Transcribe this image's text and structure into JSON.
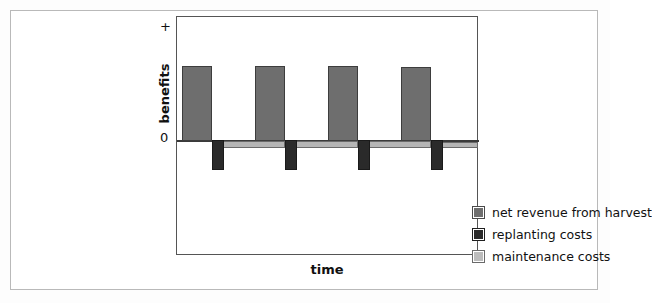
{
  "chart_data": {
    "type": "bar",
    "title": "",
    "subtitle": "",
    "xlabel": "time",
    "ylabel": "benefits",
    "ytick_labels": [
      "+",
      "0"
    ],
    "grid": false,
    "legend_position": "inside-bottom-right",
    "axis_note": "qualitative axes; no numeric scale shown",
    "categories": [
      "cycle 1",
      "cycle 2",
      "cycle 3",
      "cycle 4"
    ],
    "series": [
      {
        "name": "net revenue from harvest",
        "color": "#6e6e6e",
        "values": [
          1.0,
          1.0,
          1.0,
          0.98
        ],
        "sign": "positive"
      },
      {
        "name": "replanting costs",
        "color": "#2a2a2a",
        "values": [
          -0.28,
          -0.28,
          -0.28,
          -0.28
        ],
        "sign": "negative"
      },
      {
        "name": "maintenance costs",
        "color": "#b5b5b5",
        "values": [
          -0.07,
          -0.07,
          -0.07,
          -0.06
        ],
        "sign": "negative"
      }
    ],
    "legend": [
      {
        "label": "net revenue from harvest",
        "swatch": "sw-revenue",
        "color": "#6e6e6e"
      },
      {
        "label": "replanting costs",
        "swatch": "sw-replant",
        "color": "#2a2a2a"
      },
      {
        "label": "maintenance costs",
        "swatch": "sw-maint",
        "color": "#b5b5b5"
      }
    ],
    "geometry": {
      "plot": {
        "left": 176,
        "top": 16,
        "width": 302,
        "height": 239
      },
      "zero_y": 123,
      "revenue_bars": [
        {
          "x": 5,
          "y": 49,
          "w": 30,
          "h": 75
        },
        {
          "x": 78,
          "y": 49,
          "w": 30,
          "h": 75
        },
        {
          "x": 151,
          "y": 49,
          "w": 30,
          "h": 75
        },
        {
          "x": 224,
          "y": 50,
          "w": 30,
          "h": 74
        }
      ],
      "replant_bars": [
        {
          "x": 35,
          "y": 123,
          "w": 12,
          "h": 30
        },
        {
          "x": 108,
          "y": 123,
          "w": 12,
          "h": 30
        },
        {
          "x": 181,
          "y": 123,
          "w": 12,
          "h": 30
        },
        {
          "x": 254,
          "y": 123,
          "w": 12,
          "h": 30
        }
      ],
      "maint_bars": [
        {
          "x": 44,
          "y": 124,
          "w": 64,
          "h": 7
        },
        {
          "x": 117,
          "y": 124,
          "w": 64,
          "h": 7
        },
        {
          "x": 190,
          "y": 124,
          "w": 64,
          "h": 7
        },
        {
          "x": 263,
          "y": 125,
          "w": 38,
          "h": 6
        }
      ]
    }
  },
  "labels": {
    "plus": "+",
    "zero": "0",
    "ylabel": "benefits",
    "xlabel": "time"
  }
}
